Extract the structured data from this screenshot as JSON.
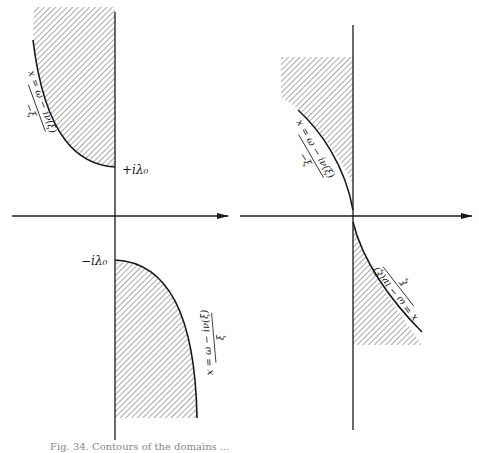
{
  "figure": {
    "caption": "Fig. 34. Contours of the domains ...",
    "left_panel": {
      "upper_label": "+iλ₀",
      "lower_label": "−iλ₀",
      "upper_curve_numerator": "x = ω − iν(ξ)",
      "upper_curve_denominator": "−ξ",
      "lower_curve_numerator": "x = ω − iν(ξ)",
      "lower_curve_denominator": "ξ"
    },
    "right_panel": {
      "upper_curve_numerator": "x = ω − iν(ξ)",
      "upper_curve_denominator": "−ξ",
      "lower_curve_numerator": "x = ω − iν(ξ)",
      "lower_curve_denominator": "ξ"
    },
    "colors": {
      "line": "#1a1a1a",
      "hatch": "#555555",
      "background": "#ffffff"
    }
  }
}
